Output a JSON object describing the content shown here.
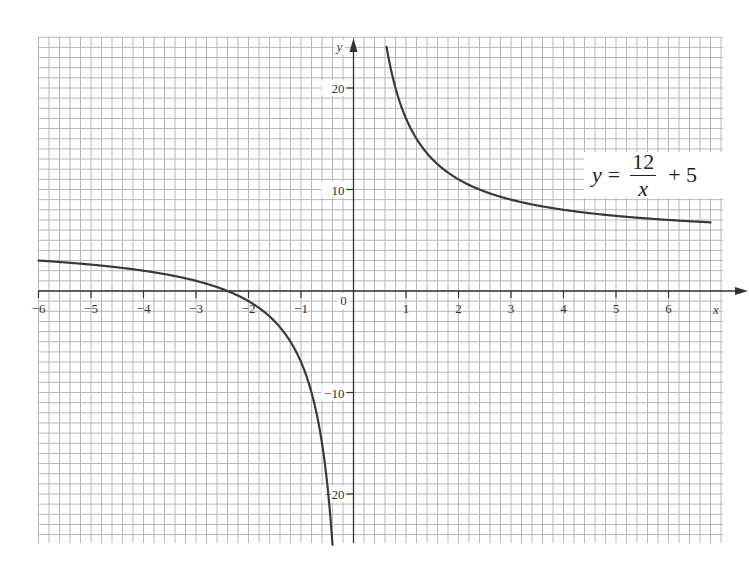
{
  "chart_data": {
    "type": "line",
    "title": "",
    "equation": {
      "lhs": "y",
      "equals": "=",
      "numerator": "12",
      "denominator": "x",
      "constant": "+ 5"
    },
    "xlabel": "x",
    "ylabel": "y",
    "xlim": [
      -6,
      6.8
    ],
    "ylim": [
      -25,
      24
    ],
    "x_ticks": [
      -6,
      -5,
      -4,
      -3,
      -2,
      -1,
      1,
      2,
      3,
      4,
      5,
      6
    ],
    "x_tick_labels": [
      "−6",
      "−5",
      "−4",
      "−3",
      "−2",
      "−1",
      "1",
      "2",
      "3",
      "4",
      "5",
      "6"
    ],
    "y_ticks": [
      20,
      10,
      -10,
      -20
    ],
    "y_tick_labels": [
      "20",
      "10",
      "−10",
      "−20"
    ],
    "origin_label": "0",
    "grid": true,
    "grid_minor_x": 0.2,
    "grid_minor_y": 1,
    "series": [
      {
        "name": "left branch",
        "x": [
          -6,
          -5.5,
          -5,
          -4.5,
          -4,
          -3.5,
          -3,
          -2.5,
          -2.4,
          -2,
          -1.5,
          -1.2,
          -1,
          -0.9,
          -0.8,
          -0.7,
          -0.6,
          -0.5,
          -0.4
        ],
        "values": [
          3,
          2.82,
          2.6,
          2.33,
          2,
          1.57,
          1,
          0.2,
          0,
          -1,
          -3,
          -5,
          -7,
          -8.33,
          -10,
          -12.14,
          -15,
          -19,
          -25
        ]
      },
      {
        "name": "right branch",
        "x": [
          0.63,
          0.7,
          0.8,
          0.9,
          1,
          1.2,
          1.5,
          2,
          2.5,
          3,
          3.5,
          4,
          4.5,
          5,
          5.5,
          6,
          6.5,
          6.8
        ],
        "values": [
          24,
          22.14,
          20,
          18.33,
          17,
          15,
          13,
          11,
          9.8,
          9,
          8.43,
          8,
          7.67,
          7.4,
          7.18,
          7,
          6.85,
          6.76
        ]
      }
    ],
    "colors": {
      "grid": "#b8b8b8",
      "axis": "#333333",
      "curve": "#3a3a3a"
    }
  }
}
